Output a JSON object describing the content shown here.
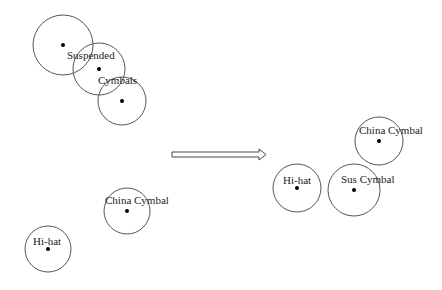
{
  "diagram": {
    "type": "cymbal-arrangement-before-after",
    "before": {
      "nodes": [
        {
          "id": "suspended-1",
          "cx": 63,
          "cy": 45,
          "r": 30,
          "label": ""
        },
        {
          "id": "suspended-2",
          "cx": 99,
          "cy": 69,
          "r": 26,
          "label": "Suspended",
          "lx": 67,
          "ly": 59
        },
        {
          "id": "suspended-3",
          "cx": 122,
          "cy": 101,
          "r": 24,
          "label": "Cymbals",
          "lx": 98,
          "ly": 84
        },
        {
          "id": "china-cymbal",
          "cx": 127,
          "cy": 211,
          "r": 23,
          "label": "China Cymbal",
          "lx": 106,
          "ly": 204
        },
        {
          "id": "hi-hat",
          "cx": 48,
          "cy": 249,
          "r": 23,
          "label": "Hi-hat",
          "lx": 33,
          "ly": 245
        }
      ]
    },
    "arrow": {
      "x1": 172,
      "x2": 266,
      "y": 154,
      "style": "hollow"
    },
    "after": {
      "nodes": [
        {
          "id": "china-cymbal",
          "cx": 379,
          "cy": 141,
          "r": 24,
          "label": "China Cymbal",
          "lx": 359,
          "ly": 134
        },
        {
          "id": "hi-hat",
          "cx": 297,
          "cy": 188,
          "r": 24,
          "label": "Hi-hat",
          "lx": 283,
          "ly": 184
        },
        {
          "id": "sus-cymbal",
          "cx": 354,
          "cy": 190,
          "r": 26,
          "label": "Sus Cymbal",
          "lx": 341,
          "ly": 183
        }
      ]
    }
  },
  "labels": {
    "b_suspended": "Suspended",
    "b_cymbals": "Cymbals",
    "b_china": "China Cymbal",
    "b_hihat": "Hi-hat",
    "a_china": "China Cymbal",
    "a_hihat": "Hi-hat",
    "a_sus": "Sus Cymbal"
  }
}
